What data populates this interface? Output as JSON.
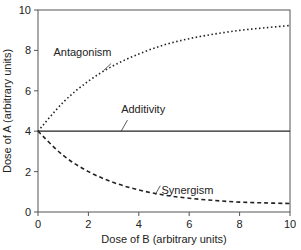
{
  "chart_data": {
    "type": "line",
    "title": "",
    "xlabel": "Dose of B (arbitrary units)",
    "ylabel": "Dose of A (arbitrary units)",
    "xlim": [
      0,
      10
    ],
    "ylim": [
      0,
      10
    ],
    "xticks": [
      "0",
      "2",
      "4",
      "6",
      "8",
      "10"
    ],
    "yticks": [
      "0",
      "2",
      "4",
      "6",
      "8",
      "10"
    ],
    "grid": false,
    "legend": "inline annotations",
    "x": [
      0,
      1,
      2,
      3,
      4,
      5,
      6,
      7,
      8,
      9,
      10
    ],
    "series": [
      {
        "name": "Antagonism",
        "style": "dotted",
        "values": [
          4.0,
          5.43,
          6.48,
          7.25,
          7.82,
          8.27,
          8.58,
          8.81,
          8.99,
          9.12,
          9.23
        ]
      },
      {
        "name": "Additivity",
        "style": "solid",
        "values": [
          4,
          4,
          4,
          4,
          4,
          4,
          4,
          4,
          4,
          4,
          4
        ]
      },
      {
        "name": "Synergism",
        "style": "dashed",
        "values": [
          4.0,
          2.8,
          2.0,
          1.46,
          1.09,
          0.84,
          0.68,
          0.57,
          0.49,
          0.45,
          0.42
        ]
      }
    ],
    "annotations": [
      {
        "text": "Antagonism",
        "x": 2.2,
        "y": 7.7
      },
      {
        "text": "Additivity",
        "x": 3.3,
        "y": 4.9
      },
      {
        "text": "Synergism",
        "x": 4.9,
        "y": 0.9
      }
    ]
  }
}
